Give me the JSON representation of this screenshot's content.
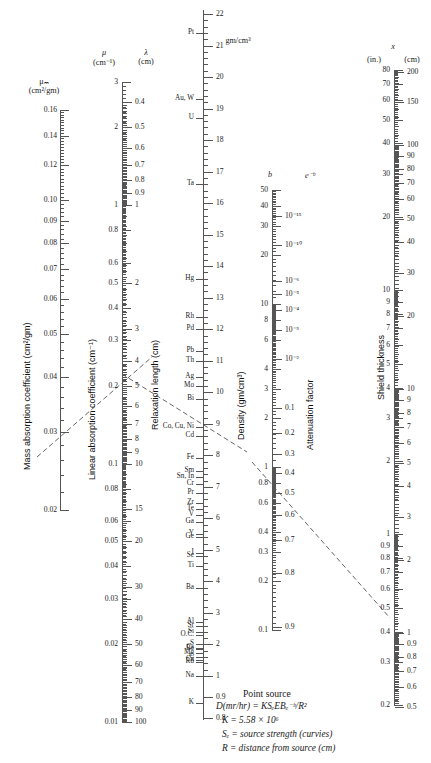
{
  "figure": {
    "kind": "nomograph",
    "width": 431,
    "height": 763
  },
  "headers": {
    "mu_m": "μₘ",
    "mu_m_units": "(cm²/gm)",
    "mu": "μ",
    "mu_units": "(cm⁻¹)",
    "lambda": "λ",
    "lambda_units": "(cm)",
    "density_units": "gm/cm³",
    "b": "b",
    "e_minus_b": "e⁻ᵇ",
    "x": "x",
    "x_in": "(in.)",
    "x_cm": "(cm)"
  },
  "axis_titles": {
    "mass_absorption": "Mass absorption coefficient (cm²/gm)",
    "linear_absorption": "Linear absorption coefficient (cm⁻¹)",
    "relaxation_length": "Relaxation length (cm)",
    "density": "Density (gm/cm³)",
    "attenuation_factor": "Attenuation factor",
    "shield_thickness": "Shield thickness"
  },
  "note": {
    "title": "Point source",
    "lines": [
      "D(mr/hr) = KSₑEBₑ⁻ᵇ/R²",
      "K = 5.58 × 10⁶",
      "Sₑ = source strength (curvies)",
      "R = distance from source (cm)"
    ]
  },
  "chart_data": {
    "type": "nomograph",
    "scales": [
      {
        "name": "mass_absorption_coefficient",
        "symbol": "μₘ",
        "units": "cm²/gm",
        "title": "Mass absorption coefficient (cm²/gm)",
        "orientation": "vertical",
        "labels_side": "left",
        "type": "log-like",
        "range": [
          0.02,
          0.16
        ],
        "ticks": [
          0.16,
          0.14,
          0.12,
          0.1,
          0.09,
          0.08,
          0.07,
          0.06,
          0.05,
          0.04,
          0.03,
          0.02
        ]
      },
      {
        "name": "linear_absorption_coefficient",
        "symbol": "μ",
        "units": "cm⁻¹",
        "title": "Linear absorption coefficient (cm⁻¹)",
        "orientation": "vertical",
        "labels_side": "left",
        "type": "log",
        "range": [
          0.01,
          3
        ],
        "ticks": [
          3,
          2,
          1,
          0.8,
          0.6,
          0.5,
          0.4,
          0.3,
          0.2,
          0.1,
          0.08,
          0.06,
          0.05,
          0.04,
          0.03,
          0.02,
          0.01
        ]
      },
      {
        "name": "relaxation_length",
        "symbol": "λ",
        "units": "cm",
        "title": "Relaxation length (cm)",
        "orientation": "vertical",
        "labels_side": "right",
        "type": "log-reciprocal",
        "range": [
          0.4,
          100
        ],
        "ticks": [
          0.4,
          0.5,
          0.6,
          0.7,
          0.8,
          0.9,
          1,
          2,
          3,
          4,
          5,
          6,
          7,
          8,
          9,
          10,
          15,
          20,
          30,
          40,
          50,
          60,
          70,
          80,
          90,
          100
        ]
      },
      {
        "name": "density",
        "symbol": "ρ",
        "units": "gm/cm³",
        "title": "density scale with element markers",
        "orientation": "vertical",
        "labels_side": "right",
        "type": "linear",
        "range": [
          0.8,
          22
        ],
        "ticks": [
          22,
          21,
          20,
          19,
          18,
          17,
          16,
          15,
          14,
          13,
          12,
          11,
          10,
          9,
          8,
          7,
          6,
          5,
          4,
          3,
          2,
          1,
          0.9,
          0.8
        ],
        "elements": [
          {
            "label": "Os, Ir",
            "value": 22.5
          },
          {
            "label": "Pt",
            "value": 21.4
          },
          {
            "label": "Au, W",
            "value": 19.3
          },
          {
            "label": "U",
            "value": 18.7
          },
          {
            "label": "Ta",
            "value": 16.6
          },
          {
            "label": "Hg",
            "value": 13.6
          },
          {
            "label": "Rh",
            "value": 12.4
          },
          {
            "label": "Pd",
            "value": 12.0
          },
          {
            "label": "Pb",
            "value": 11.3
          },
          {
            "label": "Th",
            "value": 11.0
          },
          {
            "label": "Ag",
            "value": 10.5
          },
          {
            "label": "Mo",
            "value": 10.2
          },
          {
            "label": "Bi",
            "value": 9.8
          },
          {
            "label": "Co, Cu, Ni",
            "value": 8.9
          },
          {
            "label": "Cd",
            "value": 8.6
          },
          {
            "label": "Fe",
            "value": 7.9
          },
          {
            "label": "Sm",
            "value": 7.5
          },
          {
            "label": "Sn, In",
            "value": 7.3
          },
          {
            "label": "Cr",
            "value": 7.1
          },
          {
            "label": "Pr",
            "value": 6.8
          },
          {
            "label": "Zr",
            "value": 6.5
          },
          {
            "label": "Te",
            "value": 6.3
          },
          {
            "label": "V",
            "value": 6.1
          },
          {
            "label": "Ga",
            "value": 5.9
          },
          {
            "label": "Y",
            "value": 5.5
          },
          {
            "label": "Ge",
            "value": 5.4
          },
          {
            "label": "I",
            "value": 4.9
          },
          {
            "label": "Se",
            "value": 4.8
          },
          {
            "label": "Ti",
            "value": 4.5
          },
          {
            "label": "Ba",
            "value": 3.8
          },
          {
            "label": "Al",
            "value": 2.7
          },
          {
            "label": "Sr",
            "value": 2.6
          },
          {
            "label": "Si",
            "value": 2.4
          },
          {
            "label": "O.C.",
            "value": 2.3
          },
          {
            "label": "S",
            "value": 2.0
          },
          {
            "label": "Cs",
            "value": 1.9
          },
          {
            "label": "Be",
            "value": 1.85
          },
          {
            "label": "Mg",
            "value": 1.74
          },
          {
            "label": "C",
            "value": 1.6
          },
          {
            "label": "Ca",
            "value": 1.5
          },
          {
            "label": "Rb",
            "value": 1.45
          },
          {
            "label": "Na",
            "value": 1.0
          },
          {
            "label": "K",
            "value": 0.87
          }
        ]
      },
      {
        "name": "b",
        "symbol": "b",
        "units": "",
        "orientation": "vertical",
        "labels_side": "left",
        "type": "log",
        "range": [
          0.1,
          50
        ],
        "ticks": [
          50,
          40,
          30,
          20,
          10,
          8,
          6,
          4,
          3,
          2,
          1,
          0.8,
          0.6,
          0.4,
          0.3,
          0.2,
          0.1
        ]
      },
      {
        "name": "attenuation_factor",
        "symbol": "e⁻ᵇ",
        "units": "",
        "title": "Attenuation factor",
        "orientation": "vertical",
        "labels_side": "right",
        "type": "exponential",
        "ticks": [
          "10⁻¹⁵",
          "10⁻¹⁰",
          "10⁻⁶",
          "10⁻⁵",
          "10⁻⁴",
          "10⁻³",
          "10⁻²",
          "0.1",
          "0.2",
          "0.3",
          "0.4",
          "0.5",
          "0.6",
          "0.7",
          "0.8",
          "0.9"
        ]
      },
      {
        "name": "shield_thickness_inches",
        "symbol": "x",
        "units": "in.",
        "title": "Shield thickness",
        "orientation": "vertical",
        "labels_side": "left",
        "type": "log",
        "range": [
          0.2,
          80
        ],
        "ticks": [
          80,
          70,
          60,
          50,
          40,
          30,
          20,
          10,
          9,
          8,
          7,
          6,
          5,
          4,
          3,
          2,
          1,
          0.9,
          0.8,
          0.7,
          0.6,
          0.5,
          0.4,
          0.3,
          0.2
        ]
      },
      {
        "name": "shield_thickness_cm",
        "symbol": "x",
        "units": "cm",
        "orientation": "vertical",
        "labels_side": "right",
        "type": "log",
        "range": [
          0.5,
          200
        ],
        "ticks": [
          200,
          150,
          100,
          90,
          80,
          70,
          60,
          50,
          40,
          30,
          20,
          10,
          9,
          8,
          7,
          6,
          5,
          4,
          3,
          2,
          1,
          0.9,
          0.8,
          0.7,
          0.6,
          0.5
        ]
      }
    ],
    "index_lines": [
      {
        "name": "index-line-left",
        "from": [
          37,
          457
        ],
        "to": [
          152,
          357
        ],
        "style": "dashed"
      },
      {
        "name": "index-line-middle",
        "from": [
          122,
          374
        ],
        "to": [
          247,
          452
        ],
        "style": "dashed"
      },
      {
        "name": "index-line-right",
        "from": [
          252,
          462
        ],
        "to": [
          390,
          618
        ],
        "style": "dashed"
      }
    ]
  }
}
